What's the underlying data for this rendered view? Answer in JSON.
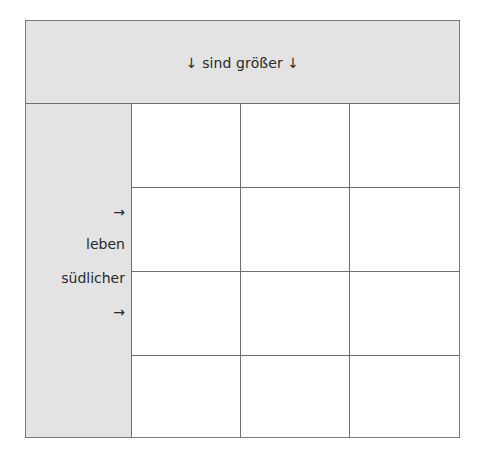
{
  "header": {
    "text": "↓ sind größer ↓"
  },
  "side": {
    "labels": [
      {
        "text": "→",
        "top": 100
      },
      {
        "text": "leben",
        "top": 132
      },
      {
        "text": "südlicher",
        "top": 166
      },
      {
        "text": "→",
        "top": 200
      }
    ]
  },
  "grid": {
    "rows": 4,
    "columns": 3,
    "cells": [
      [
        "",
        "",
        ""
      ],
      [
        "",
        "",
        ""
      ],
      [
        "",
        "",
        ""
      ],
      [
        "",
        "",
        ""
      ]
    ]
  },
  "colors": {
    "header_fill": "#e3e3e3",
    "side_fill": "#e3e3e3",
    "cell_fill": "#ffffff",
    "line": "#6f6f6f",
    "text": "#2a2a2a"
  }
}
